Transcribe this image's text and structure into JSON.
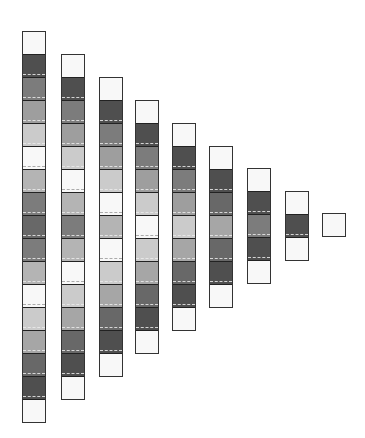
{
  "diagram": {
    "title": "",
    "shades": {
      "white": "#f8f8f8",
      "light": "#cbcbcb",
      "light-mid": "#b4b4b4",
      "lighter": "#9e9e9e",
      "mid-light": "#a6a6a6",
      "mid": "#7c7c7c",
      "mid-dark": "#686868",
      "dark": "#4f4f4f"
    },
    "layout": {
      "segment_height": 23,
      "column_width": 22,
      "column_x": [
        22,
        61,
        99,
        135,
        172,
        209,
        247,
        285,
        322
      ],
      "column_top": [
        31,
        54,
        77,
        100,
        123,
        146,
        168,
        191,
        213
      ]
    },
    "columns": [
      {
        "count": 17,
        "segments": [
          "white",
          "dark",
          "mid",
          "lighter",
          "light",
          "white",
          "light-mid",
          "mid",
          "mid-dark",
          "mid",
          "light-mid",
          "white",
          "light",
          "mid-light",
          "mid-dark",
          "dark",
          "white"
        ]
      },
      {
        "count": 15,
        "segments": [
          "white",
          "dark",
          "mid",
          "lighter",
          "light",
          "white",
          "light-mid",
          "mid",
          "light-mid",
          "white",
          "light",
          "mid-light",
          "mid-dark",
          "dark",
          "white"
        ]
      },
      {
        "count": 13,
        "segments": [
          "white",
          "dark",
          "mid",
          "lighter",
          "light",
          "white",
          "light-mid",
          "white",
          "light",
          "mid-light",
          "mid-dark",
          "dark",
          "white"
        ]
      },
      {
        "count": 11,
        "segments": [
          "white",
          "dark",
          "mid",
          "lighter",
          "light",
          "white",
          "light",
          "mid-light",
          "mid-dark",
          "dark",
          "white"
        ]
      },
      {
        "count": 9,
        "segments": [
          "white",
          "dark",
          "mid",
          "lighter",
          "light",
          "mid-light",
          "mid-dark",
          "dark",
          "white"
        ]
      },
      {
        "count": 7,
        "segments": [
          "white",
          "dark",
          "mid-dark",
          "mid-light",
          "mid-dark",
          "dark",
          "white"
        ]
      },
      {
        "count": 5,
        "segments": [
          "white",
          "dark",
          "mid",
          "dark",
          "white"
        ]
      },
      {
        "count": 3,
        "segments": [
          "white",
          "dark",
          "white"
        ]
      },
      {
        "count": 1,
        "segments": [
          "white"
        ]
      }
    ]
  }
}
